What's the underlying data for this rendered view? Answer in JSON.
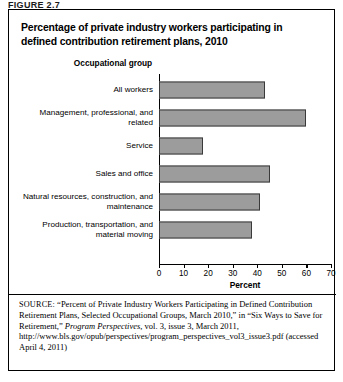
{
  "figure": {
    "label": "FIGURE 2.7"
  },
  "chart_title": "Percentage of private industry workers participating in defined contribution retirement plans, 2010",
  "chart_data": {
    "type": "bar",
    "orientation": "horizontal",
    "title": "Percentage of private industry workers participating in defined contribution retirement plans, 2010",
    "group_header": "Occupational group",
    "categories": [
      "All workers",
      "Management, professional, and related",
      "Service",
      "Sales and office",
      "Natural resources, construction, and maintenance",
      "Production, transportation, and material moving"
    ],
    "values": [
      43,
      60,
      18,
      45,
      41,
      38
    ],
    "xlabel": "Percent",
    "ylabel": "",
    "xlim": [
      0,
      70
    ],
    "xticks": [
      0,
      10,
      20,
      30,
      40,
      50,
      60,
      70
    ],
    "grid": false,
    "legend": false,
    "bar_color": "#9c9c9c",
    "bar_edge_color": "#3a3a3a"
  },
  "source": {
    "prefix": "SOURCE:",
    "text_part1": " “Percent of Private Industry Workers Participating in Defined Contribution Retirement Plans, Selected Occupational Groups, March 2010,” in “Six Ways to Save for Retirement,” ",
    "italic_title": "Program Perspectives",
    "text_part2": ", vol. 3, issue 3, March 2011, http://www.bls.gov/opub/perspectives/program_perspectives_vol3_issue3.pdf (accessed April 4, 2011)"
  }
}
